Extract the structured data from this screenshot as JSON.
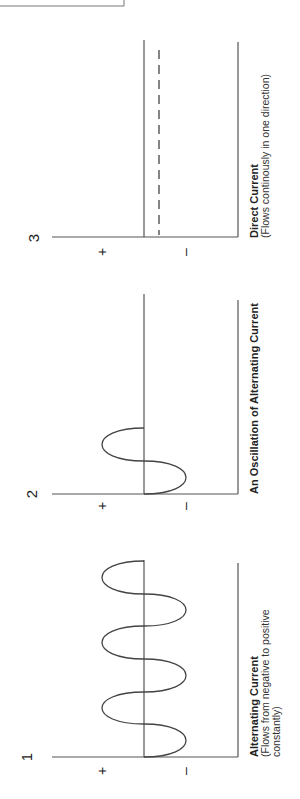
{
  "diagram": {
    "orientation": "rotated-90",
    "panels": [
      {
        "number": "1",
        "title": "Alternating Current",
        "subtitle_line1": "(Flows from negative to positive",
        "subtitle_line2": "constantly)",
        "positive_label": "+",
        "negative_label": "–",
        "waveform": "sine",
        "cycles": 3
      },
      {
        "number": "2",
        "title": "An Oscillation of Alternating Current",
        "positive_label": "+",
        "negative_label": "–",
        "waveform": "sine",
        "cycles": 1
      },
      {
        "number": "3",
        "title": "Direct Current",
        "subtitle_line1": "(Flows continously in one direction)",
        "positive_label": "+",
        "negative_label": "–",
        "waveform": "dashed-constant",
        "cycles": 0
      }
    ]
  }
}
